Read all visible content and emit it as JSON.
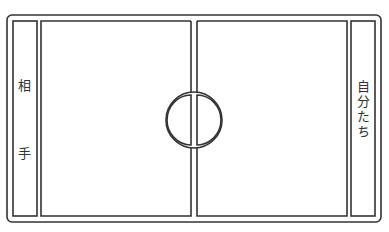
{
  "diagram": {
    "type": "court-layout",
    "line_color": "#333333",
    "background": "#ffffff",
    "left_zone": {
      "label_top": "相",
      "label_bottom": "手"
    },
    "right_zone": {
      "label": "自分たち"
    },
    "center": {
      "feature": "center-circle-with-halfway-line"
    }
  }
}
